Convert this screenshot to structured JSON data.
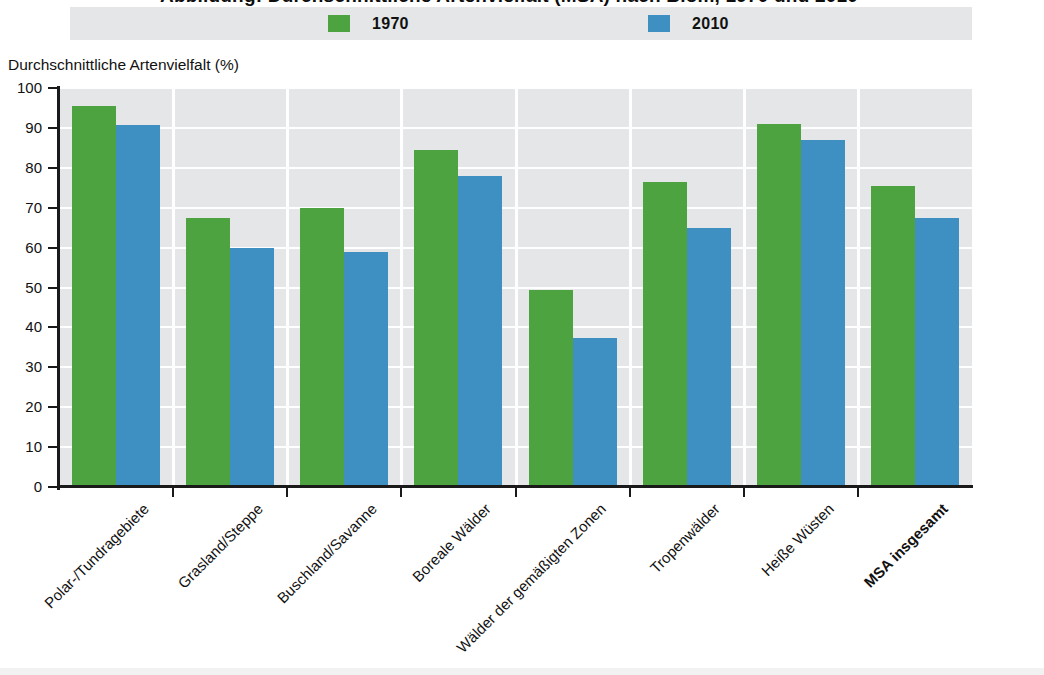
{
  "title": "Abbildung: Durchschnittliche Artenvielfalt (MSA) nach Biom, 1970 und 2010",
  "legend": {
    "items": [
      {
        "label": "1970",
        "color": "#4da33f",
        "swatch_name": "legend-swatch-1970"
      },
      {
        "label": "2010",
        "color": "#3f90c2",
        "swatch_name": "legend-swatch-2010"
      }
    ]
  },
  "axis": {
    "y_title": "Durchschnittliche Artenvielfalt (%)",
    "y_ticks": [
      "100",
      "90",
      "80",
      "70",
      "60",
      "50",
      "40",
      "30",
      "20",
      "10",
      "0"
    ]
  },
  "chart_data": {
    "type": "bar",
    "title": "Durchschnittliche Artenvielfalt (MSA) nach Biom, 1970 und 2010",
    "xlabel": "",
    "ylabel": "Durchschnittliche Artenvielfalt (%)",
    "ylim": [
      0,
      100
    ],
    "ytick_step": 10,
    "grid": "horizontal-and-vertical-white",
    "legend_position": "top",
    "categories": [
      "Polar-/Tundragebiete",
      "Grasland/Steppe",
      "Buschland/Savanne",
      "Boreale Wälder",
      "Wälder der gemäßigten Zonen",
      "Tropenwälder",
      "Heiße Wüsten",
      "MSA insgesamt"
    ],
    "category_emphasis": [
      false,
      false,
      false,
      false,
      false,
      false,
      false,
      true
    ],
    "series": [
      {
        "name": "1970",
        "color": "#4da33f",
        "values": [
          95.5,
          67.5,
          70.0,
          84.5,
          49.5,
          76.5,
          91.0,
          75.5
        ]
      },
      {
        "name": "2010",
        "color": "#3f90c2",
        "values": [
          90.8,
          60.0,
          59.0,
          78.0,
          37.3,
          65.0,
          87.0,
          67.5
        ]
      }
    ]
  }
}
